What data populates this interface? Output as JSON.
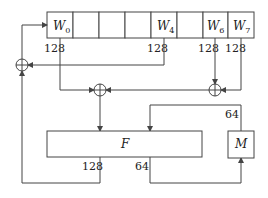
{
  "register": {
    "cells": [
      "W",
      "",
      "",
      "",
      "W",
      "",
      "W",
      "W"
    ],
    "subscripts": [
      "0",
      "",
      "",
      "",
      "4",
      "",
      "6",
      "7"
    ]
  },
  "bit_widths": {
    "w0": "128",
    "w4": "128",
    "w6": "128",
    "w7": "128",
    "f_out_left": "128",
    "f_out_right": "64",
    "m_out": "64"
  },
  "blocks": {
    "f": "F",
    "m": "M"
  }
}
